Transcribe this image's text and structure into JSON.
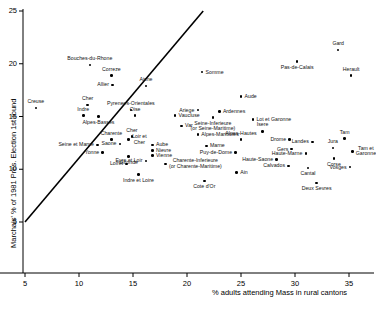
{
  "chart_data": {
    "type": "scatter",
    "title": "",
    "xlabel": "% adults attending Mass in rural cantons",
    "ylabel": "Marchais' % of 1981 Pres. Election 1st round",
    "xlim": [
      5.0,
      37.5
    ],
    "ylim": [
      3.5,
      25.0
    ],
    "xticks": [
      5,
      10,
      15,
      20,
      25,
      30,
      35
    ],
    "yticks": [
      5,
      10,
      15,
      20,
      25
    ],
    "grid": false,
    "legend": null,
    "trendline": {
      "label": "regression line",
      "x": [
        5.0,
        21.5
      ],
      "y": [
        5.0,
        25.0
      ]
    },
    "points": [
      {
        "label": "Creuse",
        "x": 6.0,
        "y": 15.8,
        "label_pos": "above"
      },
      {
        "label": "Bouches-du-Rhone",
        "x": 11.0,
        "y": 19.9,
        "label_pos": "above"
      },
      {
        "label": "Correze",
        "x": 13.0,
        "y": 18.9,
        "label_pos": "above"
      },
      {
        "label": "Allier",
        "x": 13.1,
        "y": 18.0,
        "label_pos": "left"
      },
      {
        "label": "Aisne",
        "x": 16.2,
        "y": 17.9,
        "label_pos": "above"
      },
      {
        "label": "Somme",
        "x": 21.4,
        "y": 19.2,
        "label_pos": "right"
      },
      {
        "label": "Pas-de-Calais",
        "x": 30.2,
        "y": 20.2,
        "label_pos": "below"
      },
      {
        "label": "Gard",
        "x": 34.0,
        "y": 21.3,
        "label_pos": "above"
      },
      {
        "label": "Herault",
        "x": 35.2,
        "y": 18.9,
        "label_pos": "above"
      },
      {
        "label": "Cher",
        "x": 10.8,
        "y": 16.1,
        "label_pos": "above"
      },
      {
        "label": "Pyrenees-Orientales",
        "x": 14.8,
        "y": 15.6,
        "label_pos": "above"
      },
      {
        "label": "Aude",
        "x": 25.0,
        "y": 16.9,
        "label_pos": "right"
      },
      {
        "label": "Indre",
        "x": 10.4,
        "y": 15.1,
        "label_pos": "above"
      },
      {
        "label": "Alpes-Basses",
        "x": 11.8,
        "y": 15.0,
        "label_pos": "below"
      },
      {
        "label": "Oise",
        "x": 15.2,
        "y": 15.1,
        "label_pos": "above"
      },
      {
        "label": "Vaucluse",
        "x": 18.9,
        "y": 15.1,
        "label_pos": "right"
      },
      {
        "label": "Ariege",
        "x": 21.0,
        "y": 15.6,
        "label_pos": "left"
      },
      {
        "label": "Ardennes",
        "x": 23.0,
        "y": 15.5,
        "label_pos": "right"
      },
      {
        "label": "Seine-Inferieure\n(or Seine-Maritime)",
        "x": 22.4,
        "y": 14.9,
        "label_pos": "below"
      },
      {
        "label": "Lot et Garonne",
        "x": 26.1,
        "y": 14.7,
        "label_pos": "right"
      },
      {
        "label": "Var",
        "x": 19.5,
        "y": 14.1,
        "label_pos": "right"
      },
      {
        "label": "Alpes-Maritimes",
        "x": 21.0,
        "y": 13.3,
        "label_pos": "right"
      },
      {
        "label": "Alpes-Hautes",
        "x": 25.0,
        "y": 12.8,
        "label_pos": "above"
      },
      {
        "label": "Isere",
        "x": 27.0,
        "y": 13.6,
        "label_pos": "above"
      },
      {
        "label": "Drome",
        "x": 29.5,
        "y": 12.8,
        "label_pos": "left"
      },
      {
        "label": "Landes",
        "x": 31.6,
        "y": 12.6,
        "label_pos": "left"
      },
      {
        "label": "Tam",
        "x": 34.6,
        "y": 12.9,
        "label_pos": "above"
      },
      {
        "label": "Jura",
        "x": 33.5,
        "y": 12.0,
        "label_pos": "above"
      },
      {
        "label": "Tam et\nGaronne",
        "x": 35.3,
        "y": 11.7,
        "label_pos": "right"
      },
      {
        "label": "Charente",
        "x": 13.0,
        "y": 12.8,
        "label_pos": "above"
      },
      {
        "label": "Loir et\nCher",
        "x": 14.6,
        "y": 12.8,
        "label_pos": "right"
      },
      {
        "label": "Saone",
        "x": 13.8,
        "y": 12.4,
        "label_pos": "left"
      },
      {
        "label": "Cher",
        "x": 14.9,
        "y": 13.1,
        "label_pos": "above"
      },
      {
        "label": "Seine et Marne",
        "x": 11.7,
        "y": 12.3,
        "label_pos": "left"
      },
      {
        "label": "Aube",
        "x": 16.8,
        "y": 12.3,
        "label_pos": "right"
      },
      {
        "label": "Nievre",
        "x": 16.8,
        "y": 11.8,
        "label_pos": "right"
      },
      {
        "label": "Marne",
        "x": 21.8,
        "y": 12.2,
        "label_pos": "right"
      },
      {
        "label": "Yonne",
        "x": 12.2,
        "y": 11.6,
        "label_pos": "left"
      },
      {
        "label": "Vienne",
        "x": 16.8,
        "y": 11.3,
        "label_pos": "right"
      },
      {
        "label": "Gironde",
        "x": 14.6,
        "y": 11.2,
        "label_pos": "below"
      },
      {
        "label": "Eure et Loir",
        "x": 16.2,
        "y": 10.8,
        "label_pos": "left"
      },
      {
        "label": "Puy-de-Dome",
        "x": 24.5,
        "y": 11.6,
        "label_pos": "left"
      },
      {
        "label": "Gers",
        "x": 29.7,
        "y": 11.9,
        "label_pos": "left"
      },
      {
        "label": "Haute-Marne",
        "x": 31.0,
        "y": 11.5,
        "label_pos": "left"
      },
      {
        "label": "Corse",
        "x": 33.6,
        "y": 11.0,
        "label_pos": "below"
      },
      {
        "label": "Loiret",
        "x": 14.4,
        "y": 10.5,
        "label_pos": "left"
      },
      {
        "label": "Charente-Inferieure\n(or Charente-Maritime)",
        "x": 18.0,
        "y": 10.5,
        "label_pos": "right"
      },
      {
        "label": "Haute-Saone",
        "x": 28.3,
        "y": 10.9,
        "label_pos": "left"
      },
      {
        "label": "Calvados",
        "x": 29.4,
        "y": 10.3,
        "label_pos": "left"
      },
      {
        "label": "Vosges",
        "x": 35.1,
        "y": 10.2,
        "label_pos": "left"
      },
      {
        "label": "Cantal",
        "x": 31.2,
        "y": 10.1,
        "label_pos": "below"
      },
      {
        "label": "Ain",
        "x": 24.6,
        "y": 9.7,
        "label_pos": "right"
      },
      {
        "label": "Indre et Loire",
        "x": 15.5,
        "y": 9.5,
        "label_pos": "below"
      },
      {
        "label": "Cote d'Or",
        "x": 21.6,
        "y": 8.9,
        "label_pos": "below"
      },
      {
        "label": "Deux Sevres",
        "x": 32.0,
        "y": 8.7,
        "label_pos": "below"
      }
    ]
  },
  "colors": {
    "axis": "#000000",
    "point": "#111111",
    "trendline": "#000000",
    "background": "#ffffff"
  }
}
